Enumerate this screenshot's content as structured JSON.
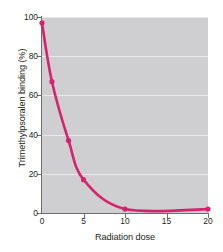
{
  "chart_data": {
    "type": "line",
    "title": "",
    "xlabel": "Radiation dose",
    "ylabel": "Trimethylpsoralen binding (%)",
    "xlim": [
      0,
      20
    ],
    "ylim": [
      0,
      100
    ],
    "xticks": [
      0,
      5,
      10,
      15,
      20
    ],
    "yticks": [
      0,
      20,
      40,
      60,
      80,
      100
    ],
    "xtick_labels": [
      "0",
      "5",
      "10",
      "15",
      "20"
    ],
    "ytick_labels": [
      "0",
      "20",
      "40",
      "60",
      "80",
      "100"
    ],
    "grid": "horizontal-only-faint-white",
    "legend": "none",
    "plot_background": "#cfcfd1",
    "figure_background": "#ffffff",
    "series": [
      {
        "name": "Trimethylpsoralen binding",
        "color": "#d5246e",
        "marker": "circle",
        "x": [
          0,
          1.2,
          3.2,
          5,
          10,
          20
        ],
        "values": [
          97,
          67,
          37,
          17,
          2,
          2
        ]
      }
    ]
  },
  "axis": {
    "x_title": "Radiation dose",
    "y_title": "Trimethylpsoralen binding (%)"
  },
  "colors": {
    "series": "#d5246e",
    "plot_bg": "#cfcfd1",
    "axis": "#6d6e71",
    "text": "#231f20"
  }
}
